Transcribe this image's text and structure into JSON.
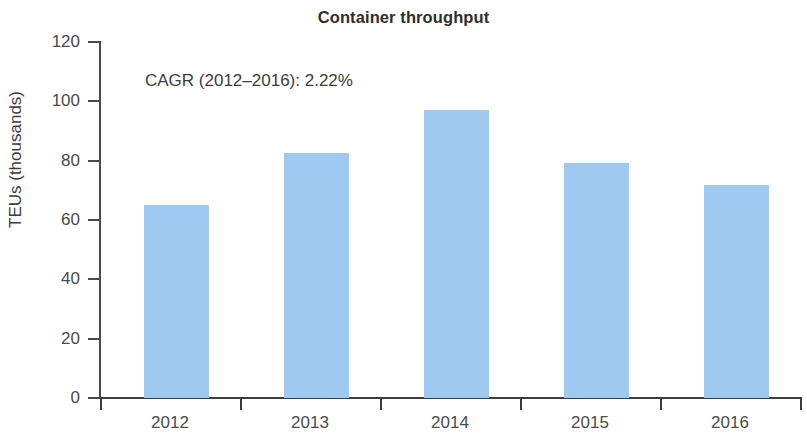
{
  "chart_data": {
    "type": "bar",
    "title": "Container throughput",
    "xlabel": "",
    "ylabel": "TEUs (thousands)",
    "categories": [
      "2012",
      "2013",
      "2014",
      "2015",
      "2016"
    ],
    "values": [
      65.0,
      82.6,
      97.1,
      79.2,
      71.8
    ],
    "ylim": [
      0,
      120
    ],
    "yticks": [
      "0",
      "20",
      "40",
      "60",
      "80",
      "100",
      "120"
    ],
    "ytick_values": [
      0,
      20,
      40,
      60,
      80,
      100,
      120
    ],
    "grid": false,
    "legend": null,
    "annotations": [
      {
        "name": "cagr-note",
        "text": "CAGR (2012–2016): 2.22%"
      }
    ],
    "colors": {
      "bar": "#9fc9f0",
      "axis": "#3d3d3d",
      "text": "#3c3c3c",
      "background": "#ffffff"
    }
  }
}
